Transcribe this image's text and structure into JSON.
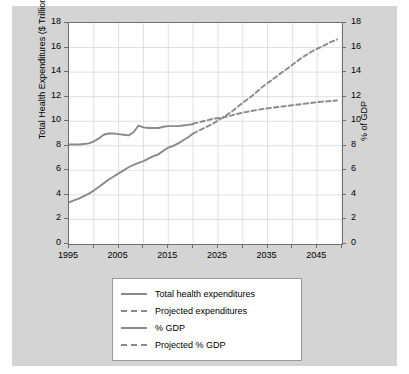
{
  "chart_data": {
    "type": "line",
    "title": "",
    "xlabel": "",
    "ylabel": "Total Health Expenditures ($ Trillion)",
    "y2label": "% of GDP",
    "xlim": [
      1995,
      2050
    ],
    "ylim": [
      0,
      18
    ],
    "y2lim": [
      0,
      18
    ],
    "grid": true,
    "legend_position": "below",
    "xticks": [
      "1995",
      "2005",
      "2015",
      "2025",
      "2035",
      "2045"
    ],
    "xtick_values": [
      1995,
      2005,
      2015,
      2025,
      2035,
      2045
    ],
    "yticks": [
      "0",
      "2",
      "4",
      "6",
      "8",
      "10",
      "12",
      "14",
      "16",
      "18"
    ],
    "ytick_values": [
      0,
      2,
      4,
      6,
      8,
      10,
      12,
      14,
      16,
      18
    ],
    "y2ticks": [
      "0",
      "2",
      "4",
      "6",
      "8",
      "10",
      "12",
      "14",
      "16",
      "18"
    ],
    "y2tick_values": [
      0,
      2,
      4,
      6,
      8,
      10,
      12,
      14,
      16,
      18
    ],
    "line_color": "#8a8a8a",
    "series": [
      {
        "name": "Total health expenditures",
        "style": "solid",
        "axis": "left",
        "unit": "$ Trillion",
        "x": [
          1995,
          1996,
          1997,
          1998,
          1999,
          2000,
          2001,
          2002,
          2003,
          2004,
          2005,
          2006,
          2007,
          2008,
          2009,
          2010,
          2011,
          2012,
          2013,
          2014,
          2015,
          2016,
          2017,
          2018,
          2019,
          2020
        ],
        "values": [
          3.4,
          3.55,
          3.7,
          3.9,
          4.1,
          4.35,
          4.65,
          4.95,
          5.25,
          5.5,
          5.75,
          6.0,
          6.25,
          6.45,
          6.6,
          6.75,
          6.95,
          7.15,
          7.3,
          7.6,
          7.85,
          8.0,
          8.2,
          8.45,
          8.7,
          9.0
        ]
      },
      {
        "name": "Projected expenditures",
        "style": "dashed",
        "axis": "left",
        "unit": "$ Trillion",
        "x": [
          2020,
          2022,
          2024,
          2026,
          2028,
          2030,
          2032,
          2034,
          2036,
          2038,
          2040,
          2042,
          2044,
          2046,
          2048,
          2049
        ],
        "values": [
          9.0,
          9.4,
          9.8,
          10.3,
          10.85,
          11.5,
          12.1,
          12.8,
          13.4,
          14.0,
          14.6,
          15.2,
          15.7,
          16.1,
          16.5,
          16.65
        ]
      },
      {
        "name": "% GDP",
        "style": "solid",
        "axis": "right",
        "unit": "% of GDP",
        "x": [
          1995,
          1996,
          1997,
          1998,
          1999,
          2000,
          2001,
          2002,
          2003,
          2004,
          2005,
          2006,
          2007,
          2008,
          2009,
          2010,
          2011,
          2012,
          2013,
          2014,
          2015,
          2016,
          2017,
          2018,
          2019,
          2020
        ],
        "values": [
          8.1,
          8.1,
          8.1,
          8.15,
          8.2,
          8.35,
          8.6,
          8.9,
          9.0,
          9.0,
          8.95,
          8.9,
          8.85,
          9.1,
          9.65,
          9.5,
          9.45,
          9.45,
          9.45,
          9.55,
          9.6,
          9.6,
          9.6,
          9.65,
          9.7,
          9.75
        ]
      },
      {
        "name": "Projected % GDP",
        "style": "dashed",
        "axis": "right",
        "unit": "% of GDP",
        "x": [
          2020,
          2022,
          2024,
          2026,
          2028,
          2030,
          2032,
          2034,
          2036,
          2038,
          2040,
          2042,
          2044,
          2046,
          2048,
          2049
        ],
        "values": [
          9.8,
          10.0,
          10.2,
          10.3,
          10.5,
          10.7,
          10.85,
          11.0,
          11.1,
          11.2,
          11.3,
          11.4,
          11.5,
          11.6,
          11.65,
          11.7
        ]
      }
    ]
  },
  "legend": {
    "items": [
      {
        "label": "Total health expenditures",
        "style": "solid"
      },
      {
        "label": "Projected expenditures",
        "style": "dashed"
      },
      {
        "label": "% GDP",
        "style": "solid"
      },
      {
        "label": "Projected % GDP",
        "style": "dashed"
      }
    ]
  }
}
